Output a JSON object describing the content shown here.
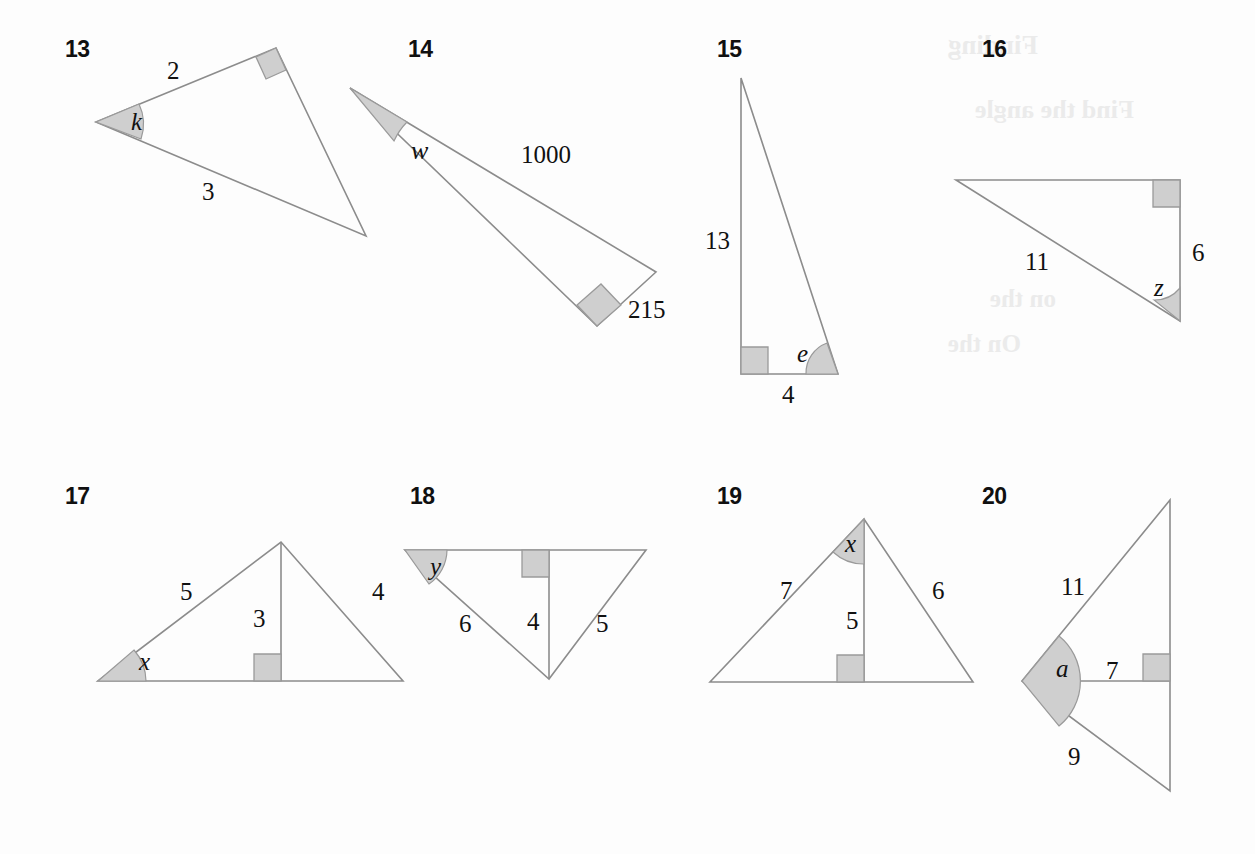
{
  "page": {
    "background_color": "#fdfdfd",
    "stroke_color": "#8c8c8c",
    "fill_color": "#cfcfcf",
    "text_color": "#111111"
  },
  "bleedthrough": [
    {
      "text": "Finding",
      "x": 948,
      "y": 30,
      "size": 27
    },
    {
      "text": "Find the angle",
      "x": 975,
      "y": 95,
      "size": 26
    },
    {
      "text": "on the",
      "x": 990,
      "y": 285,
      "size": 25
    },
    {
      "text": "On the",
      "x": 948,
      "y": 330,
      "size": 25
    }
  ],
  "problems": [
    {
      "number": "13",
      "num_x": 65,
      "num_y": 36,
      "type": "obtuse-scalene-right-triangle",
      "description": "Right triangle rotated; right angle at upper-right vertex, unknown angle k at left vertex",
      "vertices": {
        "left": [
          96,
          122
        ],
        "top_right": [
          276,
          48
        ],
        "bottom_right": [
          366,
          236
        ]
      },
      "labels": [
        {
          "text": "2",
          "style": "plain",
          "x": 167,
          "y": 57,
          "name": "side-2"
        },
        {
          "text": "3",
          "style": "plain",
          "x": 202,
          "y": 178,
          "name": "side-3"
        },
        {
          "text": "k",
          "style": "italic",
          "x": 131,
          "y": 108,
          "name": "angle-k"
        }
      ],
      "marks": {
        "angle_vertex": "left",
        "right_angle_vertex": "top_right"
      }
    },
    {
      "number": "14",
      "num_x": 408,
      "num_y": 36,
      "type": "very-thin-right-triangle",
      "description": "Long thin right triangle; right angle at bottom vertex, unknown angle w at top-left apex",
      "vertices": {
        "apex": [
          350,
          88
        ],
        "right": [
          656,
          272
        ],
        "bottom": [
          597,
          326
        ]
      },
      "labels": [
        {
          "text": "w",
          "style": "italic",
          "x": 411,
          "y": 136,
          "name": "angle-w"
        },
        {
          "text": "1000",
          "style": "plain",
          "x": 521,
          "y": 141,
          "name": "side-1000"
        },
        {
          "text": "215",
          "style": "plain",
          "x": 628,
          "y": 296,
          "name": "side-215"
        }
      ],
      "marks": {
        "angle_vertex": "apex",
        "right_angle_vertex": "bottom"
      }
    },
    {
      "number": "15",
      "num_x": 717,
      "num_y": 36,
      "type": "tall-thin-right-triangle",
      "description": "Tall right triangle; right angle at bottom-left, unknown angle e at bottom-right",
      "vertices": {
        "apex": [
          741,
          78
        ],
        "bottom_left": [
          741,
          374
        ],
        "bottom_right": [
          838,
          374
        ]
      },
      "labels": [
        {
          "text": "13",
          "style": "plain",
          "x": 705,
          "y": 227,
          "name": "side-13"
        },
        {
          "text": "4",
          "style": "plain",
          "x": 782,
          "y": 381,
          "name": "side-4"
        },
        {
          "text": "e",
          "style": "italic",
          "x": 797,
          "y": 340,
          "name": "angle-e"
        }
      ],
      "marks": {
        "angle_vertex": "bottom_right",
        "right_angle_vertex": "bottom_left"
      }
    },
    {
      "number": "16",
      "num_x": 982,
      "num_y": 36,
      "type": "right-triangle",
      "description": "Right triangle; right angle at top-right, unknown angle z at bottom-right",
      "vertices": {
        "top_left": [
          956,
          180
        ],
        "top_right": [
          1180,
          180
        ],
        "bottom_right": [
          1180,
          321
        ]
      },
      "labels": [
        {
          "text": "11",
          "style": "plain",
          "x": 1025,
          "y": 248,
          "name": "side-11"
        },
        {
          "text": "6",
          "style": "plain",
          "x": 1192,
          "y": 239,
          "name": "side-6"
        },
        {
          "text": "z",
          "style": "italic",
          "x": 1154,
          "y": 274,
          "name": "angle-z"
        }
      ],
      "marks": {
        "angle_vertex": "bottom_right",
        "right_angle_vertex": "top_right"
      }
    },
    {
      "number": "17",
      "num_x": 65,
      "num_y": 483,
      "type": "triangle-with-altitude",
      "description": "Triangle with interior altitude of length 3; unknown angle x at bottom-left",
      "vertices": {
        "left": [
          98,
          681
        ],
        "apex": [
          281,
          542
        ],
        "right": [
          403,
          681
        ],
        "foot": [
          281,
          681
        ]
      },
      "labels": [
        {
          "text": "5",
          "style": "plain",
          "x": 180,
          "y": 578,
          "name": "side-5"
        },
        {
          "text": "4",
          "style": "plain",
          "x": 372,
          "y": 578,
          "name": "side-4"
        },
        {
          "text": "3",
          "style": "plain",
          "x": 253,
          "y": 605,
          "name": "altitude-3"
        },
        {
          "text": "x",
          "style": "italic",
          "x": 139,
          "y": 648,
          "name": "angle-x"
        }
      ],
      "marks": {
        "angle_vertex": "left",
        "right_angle_at_foot": true
      }
    },
    {
      "number": "18",
      "num_x": 410,
      "num_y": 483,
      "type": "inverted-triangle-with-altitude",
      "description": "Downward pointing triangle with altitude of length 4; unknown angle y at top-left",
      "vertices": {
        "top_left": [
          405,
          550
        ],
        "top_right": [
          646,
          550
        ],
        "bottom": [
          549,
          679
        ],
        "foot": [
          549,
          550
        ]
      },
      "labels": [
        {
          "text": "y",
          "style": "italic",
          "x": 430,
          "y": 553,
          "name": "angle-y"
        },
        {
          "text": "6",
          "style": "plain",
          "x": 459,
          "y": 610,
          "name": "side-6"
        },
        {
          "text": "4",
          "style": "plain",
          "x": 527,
          "y": 608,
          "name": "altitude-4"
        },
        {
          "text": "5",
          "style": "plain",
          "x": 596,
          "y": 610,
          "name": "side-5"
        }
      ],
      "marks": {
        "angle_vertex": "top_left",
        "right_angle_at_foot": true
      }
    },
    {
      "number": "19",
      "num_x": 717,
      "num_y": 483,
      "type": "triangle-with-altitude",
      "description": "Triangle with altitude of length 5; unknown angle x at apex between left side and altitude",
      "vertices": {
        "apex": [
          864,
          519
        ],
        "left": [
          710,
          682
        ],
        "right": [
          973,
          682
        ],
        "foot": [
          864,
          682
        ]
      },
      "labels": [
        {
          "text": "7",
          "style": "plain",
          "x": 780,
          "y": 577,
          "name": "side-7"
        },
        {
          "text": "6",
          "style": "plain",
          "x": 932,
          "y": 577,
          "name": "side-6"
        },
        {
          "text": "5",
          "style": "plain",
          "x": 846,
          "y": 607,
          "name": "altitude-5"
        },
        {
          "text": "x",
          "style": "italic",
          "x": 845,
          "y": 530,
          "name": "angle-x"
        }
      ],
      "marks": {
        "angle_vertex": "apex",
        "right_angle_at_foot": true
      }
    },
    {
      "number": "20",
      "num_x": 982,
      "num_y": 483,
      "type": "sideways-triangle-with-altitude",
      "description": "Left-pointing triangle with horizontal altitude of length 7; unknown angle a at left vertex",
      "vertices": {
        "left": [
          1022,
          681
        ],
        "top": [
          1170,
          500
        ],
        "bottom": [
          1170,
          791
        ],
        "foot": [
          1170,
          681
        ]
      },
      "labels": [
        {
          "text": "11",
          "style": "plain",
          "x": 1061,
          "y": 573,
          "name": "side-11"
        },
        {
          "text": "a",
          "style": "italic",
          "x": 1056,
          "y": 655,
          "name": "angle-a"
        },
        {
          "text": "7",
          "style": "plain",
          "x": 1106,
          "y": 657,
          "name": "altitude-7"
        },
        {
          "text": "9",
          "style": "plain",
          "x": 1068,
          "y": 743,
          "name": "side-9"
        }
      ],
      "marks": {
        "angle_vertex": "left",
        "right_angle_at_foot": true
      }
    }
  ]
}
